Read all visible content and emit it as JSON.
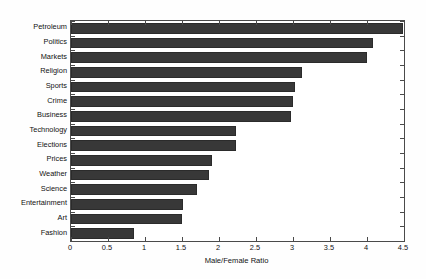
{
  "chart_data": {
    "type": "bar",
    "orientation": "horizontal",
    "title": "",
    "xlabel": "Male/Female Ratio",
    "ylabel": "",
    "xlim": [
      0,
      4.5
    ],
    "xticks": [
      0,
      0.5,
      1,
      1.5,
      2,
      2.5,
      3,
      3.5,
      4,
      4.5
    ],
    "xtick_labels": [
      "0",
      "0.5",
      "1",
      "1.5",
      "2",
      "2.5",
      "3",
      "3.5",
      "4",
      "4.5"
    ],
    "grid": false,
    "legend": null,
    "bar_color": "#383838",
    "categories": [
      "Petroleum",
      "Politics",
      "Markets",
      "Religion",
      "Sports",
      "Crime",
      "Business",
      "Technology",
      "Elections",
      "Prices",
      "Weather",
      "Science",
      "Entertainment",
      "Art",
      "Fashion"
    ],
    "values": [
      4.49,
      4.08,
      4.0,
      3.12,
      3.03,
      3.0,
      2.97,
      2.23,
      2.23,
      1.9,
      1.86,
      1.7,
      1.51,
      1.5,
      0.85
    ]
  }
}
